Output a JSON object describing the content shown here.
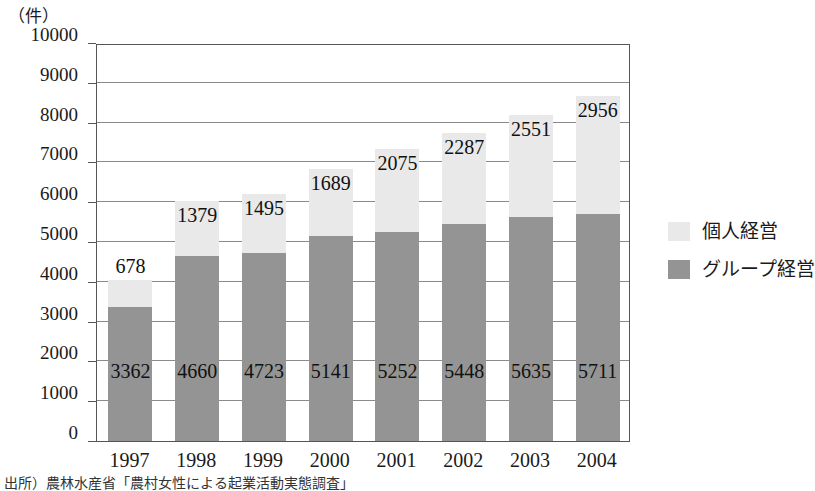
{
  "unit_label": "（件）",
  "source_note": "出所）農林水産省「農村女性による起業活動実態調査」",
  "legend": {
    "position": "right",
    "entries": [
      {
        "label": "個人経営",
        "swatch": "light-gray-swatch",
        "color": "#e9e9e9"
      },
      {
        "label": "グループ経営",
        "swatch": "dark-gray-swatch",
        "color": "#949494"
      }
    ]
  },
  "chart_data": {
    "type": "bar",
    "stacked": true,
    "title": "",
    "subtitle": "",
    "xlabel": "",
    "ylabel": "（件）",
    "ylim": [
      0,
      10000
    ],
    "ytick_step": 1000,
    "yticks": [
      "10000",
      "9000",
      "8000",
      "7000",
      "6000",
      "5000",
      "4000",
      "3000",
      "2000",
      "1000",
      "0"
    ],
    "grid": true,
    "legend_position": "right",
    "categories": [
      "1997",
      "1998",
      "1999",
      "2000",
      "2001",
      "2002",
      "2003",
      "2004"
    ],
    "series": [
      {
        "name": "グループ経営",
        "color": "#949494",
        "values": [
          3362,
          4660,
          4723,
          5141,
          5252,
          5448,
          5635,
          5711
        ]
      },
      {
        "name": "個人経営",
        "color": "#e9e9e9",
        "values": [
          678,
          1379,
          1495,
          1689,
          2075,
          2287,
          2551,
          2956
        ]
      }
    ],
    "totals": [
      4040,
      6039,
      6218,
      6830,
      7327,
      7735,
      8186,
      8667
    ]
  }
}
